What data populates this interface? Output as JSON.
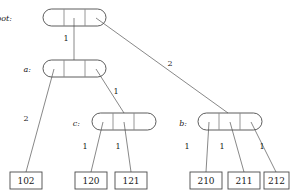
{
  "diagram": {
    "type": "trie-tree",
    "title": "",
    "internal_nodes": [
      {
        "id": "root",
        "label": "root:",
        "label_x": 12,
        "label_y": 21,
        "x": 43,
        "y": 9,
        "w": 63,
        "h": 17,
        "cells": 3,
        "divider_x": [
          64,
          85
        ]
      },
      {
        "id": "a",
        "label": "a:",
        "label_x": 31,
        "label_y": 72,
        "x": 43,
        "y": 60,
        "w": 63,
        "h": 17,
        "cells": 3,
        "divider_x": [
          64,
          85
        ]
      },
      {
        "id": "c",
        "label": "c:",
        "label_x": 80,
        "label_y": 126,
        "x": 92,
        "y": 113,
        "w": 64,
        "h": 17,
        "cells": 3,
        "divider_x": [
          113,
          134
        ]
      },
      {
        "id": "b",
        "label": "b:",
        "label_x": 187,
        "label_y": 126,
        "x": 198,
        "y": 113,
        "w": 64,
        "h": 17,
        "cells": 3,
        "divider_x": [
          219,
          240
        ]
      }
    ],
    "leaf_nodes": [
      {
        "id": "leaf-102",
        "value": "102",
        "x": 10,
        "y": 172,
        "w": 32,
        "h": 17
      },
      {
        "id": "leaf-120",
        "value": "120",
        "x": 75,
        "y": 172,
        "w": 32,
        "h": 17
      },
      {
        "id": "leaf-121",
        "value": "121",
        "x": 115,
        "y": 172,
        "w": 32,
        "h": 17
      },
      {
        "id": "leaf-210",
        "value": "210",
        "x": 190,
        "y": 172,
        "w": 32,
        "h": 17
      },
      {
        "id": "leaf-211",
        "value": "211",
        "x": 228,
        "y": 172,
        "w": 32,
        "h": 17
      },
      {
        "id": "leaf-212",
        "value": "212",
        "x": 264,
        "y": 172,
        "w": 25,
        "h": 17
      }
    ],
    "edges": [
      {
        "id": "edge-root-a",
        "from": "root",
        "to": "a",
        "x1": 74,
        "y1": 18,
        "x2": 74,
        "y2": 60,
        "label": "1",
        "label_x": 66,
        "label_y": 41
      },
      {
        "id": "edge-root-b",
        "from": "root",
        "to": "b",
        "x1": 96,
        "y1": 18,
        "x2": 228,
        "y2": 113,
        "label": "2",
        "label_x": 170,
        "label_y": 66
      },
      {
        "id": "edge-a-102",
        "from": "a",
        "to": "leaf-102",
        "x1": 54,
        "y1": 69,
        "x2": 26,
        "y2": 172,
        "label": "2",
        "label_x": 26,
        "label_y": 121
      },
      {
        "id": "edge-a-c",
        "from": "a",
        "to": "c",
        "x1": 96,
        "y1": 69,
        "x2": 124,
        "y2": 113,
        "label": "1",
        "label_x": 116,
        "label_y": 94
      },
      {
        "id": "edge-c-120",
        "from": "c",
        "to": "leaf-120",
        "x1": 103,
        "y1": 122,
        "x2": 91,
        "y2": 172,
        "label": "1",
        "label_x": 85,
        "label_y": 149
      },
      {
        "id": "edge-c-121",
        "from": "c",
        "to": "leaf-121",
        "x1": 124,
        "y1": 122,
        "x2": 131,
        "y2": 172,
        "label": "1",
        "label_x": 118,
        "label_y": 149
      },
      {
        "id": "edge-b-210",
        "from": "b",
        "to": "leaf-210",
        "x1": 209,
        "y1": 122,
        "x2": 206,
        "y2": 172,
        "label": "1",
        "label_x": 187,
        "label_y": 149
      },
      {
        "id": "edge-b-211",
        "from": "b",
        "to": "leaf-211",
        "x1": 230,
        "y1": 122,
        "x2": 244,
        "y2": 172,
        "label": "1",
        "label_x": 222,
        "label_y": 149
      },
      {
        "id": "edge-b-212",
        "from": "b",
        "to": "leaf-212",
        "x1": 251,
        "y1": 122,
        "x2": 276,
        "y2": 172,
        "label": "1",
        "label_x": 262,
        "label_y": 149
      }
    ],
    "colors": {
      "stroke": "#4a4a4a",
      "divider": "#8a8a8a",
      "edge": "#6a6a6a",
      "text": "#1a1a1a",
      "background": "#ffffff"
    }
  }
}
